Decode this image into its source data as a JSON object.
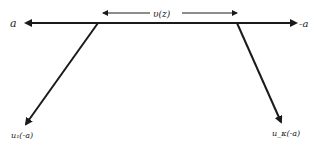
{
  "diagram": {
    "top_left_label": "a",
    "top_right_label": "-a",
    "span_label": "υ(z)",
    "bottom_left_label": "u₁(-a)",
    "bottom_right_label": "u_κ(-a)",
    "stroke_color": "#1a1a1a"
  }
}
